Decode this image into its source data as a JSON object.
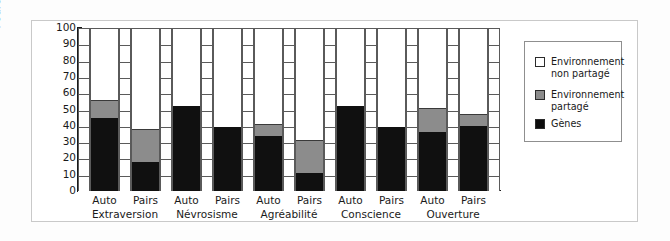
{
  "chart": {
    "ylabel": "Pourcentage de variance",
    "yticks": [
      "100",
      "90",
      "80",
      "70",
      "60",
      "50",
      "40",
      "30",
      "20",
      "10",
      "0"
    ],
    "legend": {
      "title": "",
      "items": [
        {
          "name": "non-shared-environment",
          "label": "Environnement\nnon partagé",
          "color": "#ffffff"
        },
        {
          "name": "shared-environment",
          "label": "Environnement\npartagé",
          "color": "#8c8c8c"
        },
        {
          "name": "genes",
          "label": "Gènes",
          "color": "#0d0d0d"
        }
      ]
    },
    "groups": [
      {
        "name": "Extraversion",
        "bars": [
          {
            "tick": "Auto"
          },
          {
            "tick": "Pairs"
          }
        ]
      },
      {
        "name": "Névrosisme",
        "bars": [
          {
            "tick": "Auto"
          },
          {
            "tick": "Pairs"
          }
        ]
      },
      {
        "name": "Agréabilité",
        "bars": [
          {
            "tick": "Auto"
          },
          {
            "tick": "Pairs"
          }
        ]
      },
      {
        "name": "Conscience",
        "bars": [
          {
            "tick": "Auto"
          },
          {
            "tick": "Pairs"
          }
        ]
      },
      {
        "name": "Ouverture",
        "bars": [
          {
            "tick": "Auto"
          },
          {
            "tick": "Pairs"
          }
        ]
      }
    ]
  },
  "chart_data": {
    "type": "bar",
    "title": "",
    "xlabel": "",
    "ylabel": "Pourcentage de variance",
    "ylim": [
      0,
      100
    ],
    "ytick_step": 10,
    "grid": true,
    "stacked": true,
    "legend_position": "right",
    "categories": [
      "Extraversion - Auto",
      "Extraversion - Pairs",
      "Névrosisme - Auto",
      "Névrosisme - Pairs",
      "Agréabilité - Auto",
      "Agréabilité - Pairs",
      "Conscience - Auto",
      "Conscience - Pairs",
      "Ouverture - Auto",
      "Ouverture - Pairs"
    ],
    "group_labels": [
      "Extraversion",
      "Névrosisme",
      "Agréabilité",
      "Conscience",
      "Ouverture"
    ],
    "bar_labels": [
      "Auto",
      "Pairs",
      "Auto",
      "Pairs",
      "Auto",
      "Pairs",
      "Auto",
      "Pairs",
      "Auto",
      "Pairs"
    ],
    "series": [
      {
        "name": "Gènes",
        "color": "#0d0d0d",
        "values": [
          45,
          18,
          52,
          39,
          34,
          11,
          52,
          39,
          36,
          40
        ]
      },
      {
        "name": "Environnement partagé",
        "color": "#8c8c8c",
        "values": [
          11,
          20,
          0,
          0,
          7,
          20,
          0,
          0,
          15,
          7
        ]
      },
      {
        "name": "Environnement non partagé",
        "color": "#ffffff",
        "values": [
          44,
          62,
          48,
          61,
          59,
          69,
          48,
          61,
          49,
          53
        ]
      }
    ],
    "stack_tops": [
      56,
      38,
      52,
      39,
      41,
      31,
      52,
      39,
      51,
      47
    ]
  }
}
